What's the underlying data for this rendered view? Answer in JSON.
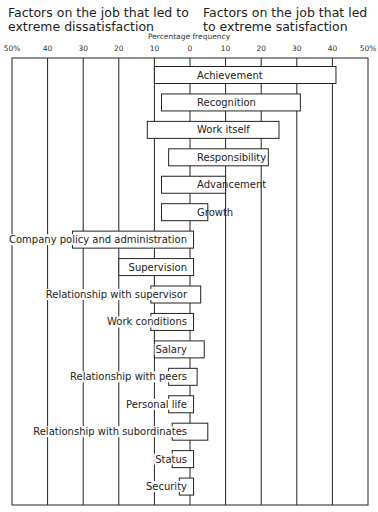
{
  "chart_data": {
    "type": "bar",
    "orientation": "horizontal-diverging",
    "title_left": "Factors on the job that led to extreme dissatisfaction",
    "title_right": "Factors on the job that led to extreme satisfaction",
    "xlabel": "Percentage frequency",
    "xlim": [
      -50,
      50
    ],
    "tick_labels": [
      "50%",
      "40",
      "30",
      "20",
      "10",
      "0",
      "10",
      "20",
      "30",
      "40",
      "50%"
    ],
    "grid": true,
    "categories": [
      "Achievement",
      "Recognition",
      "Work itself",
      "Responsibility",
      "Advancement",
      "Growth",
      "Company policy and administration",
      "Supervision",
      "Relationship with supervisor",
      "Work conditions",
      "Salary",
      "Relationship with peers",
      "Personal life",
      "Relationship with subordinates",
      "Status",
      "Security"
    ],
    "series": [
      {
        "name": "Dissatisfaction",
        "values": [
          10,
          8,
          12,
          6,
          8,
          8,
          33,
          20,
          11,
          11,
          10,
          6,
          6,
          5,
          5,
          3
        ]
      },
      {
        "name": "Satisfaction",
        "values": [
          41,
          31,
          25,
          22,
          10,
          5,
          1,
          1,
          3,
          1,
          4,
          2,
          1,
          5,
          1,
          1
        ]
      }
    ],
    "label_positions": [
      "inside-right",
      "inside-right",
      "inside-right",
      "inside-right",
      "inside-right",
      "inside-right",
      "left",
      "left",
      "left",
      "left",
      "left",
      "left",
      "left",
      "left",
      "left",
      "left"
    ]
  }
}
